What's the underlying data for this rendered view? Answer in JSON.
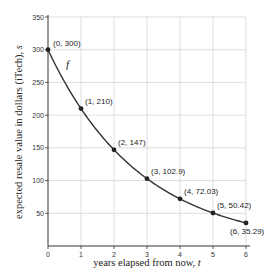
{
  "chart_data": {
    "type": "line",
    "title": "",
    "xlabel": "years elapsed from now, t",
    "ylabel": "expected resale value in dollars (iTech), s",
    "xlabel_text": "years elapsed from now, ",
    "xlabel_var": "t",
    "ylabel_text": "expected resale value in dollars (iTech), ",
    "ylabel_var": "s",
    "function_label": "f",
    "xlim": [
      0,
      6
    ],
    "ylim": [
      0,
      350
    ],
    "grid": true,
    "x_ticks": [
      "0",
      "1",
      "2",
      "3",
      "4",
      "5",
      "6"
    ],
    "y_ticks": [
      "50",
      "100",
      "150",
      "200",
      "250",
      "300",
      "350"
    ],
    "series": [
      {
        "name": "f",
        "x": [
          0,
          1,
          2,
          3,
          4,
          5,
          6
        ],
        "values": [
          300,
          210,
          147,
          102.9,
          72.03,
          50.42,
          35.29
        ]
      }
    ],
    "point_labels": [
      "(0, 300)",
      "(1, 210)",
      "(2, 147)",
      "(3, 102.9)",
      "(4, 72.03)",
      "(5, 50.42)",
      "(6, 35.29)"
    ]
  }
}
